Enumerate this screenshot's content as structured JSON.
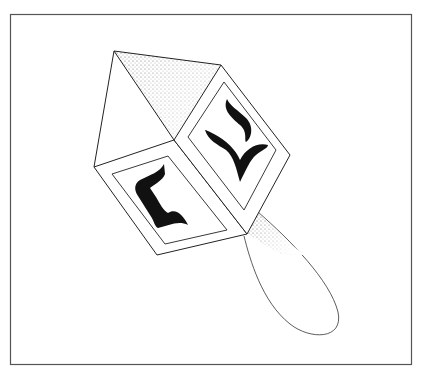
{
  "illustration": {
    "subject": "Dreidel",
    "style": "pen-and-ink stippled line drawing",
    "letters": [
      "ג",
      "ש"
    ],
    "colors": {
      "ink": "#1a1a1a",
      "paper": "#ffffff",
      "frame": "#555555"
    }
  }
}
